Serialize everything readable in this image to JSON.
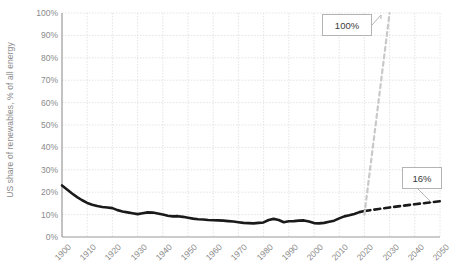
{
  "chart_data": {
    "type": "line",
    "title": "",
    "xlabel": "",
    "ylabel": "US share of renewables, % of all energy",
    "xlim": [
      1900,
      2050
    ],
    "ylim": [
      0,
      100
    ],
    "grid": true,
    "legend_position": "none",
    "ytick_labels": [
      "0%",
      "10%",
      "20%",
      "30%",
      "40%",
      "50%",
      "60%",
      "70%",
      "80%",
      "90%",
      "100%"
    ],
    "ytick_values": [
      0,
      10,
      20,
      30,
      40,
      50,
      60,
      70,
      80,
      90,
      100
    ],
    "xtick_labels": [
      "1900",
      "1910",
      "1920",
      "1930",
      "1940",
      "1950",
      "1960",
      "1970",
      "1980",
      "1990",
      "2000",
      "2010",
      "2020",
      "2030",
      "2040",
      "2050"
    ],
    "xtick_values": [
      1900,
      1910,
      1920,
      1930,
      1940,
      1950,
      1960,
      1970,
      1980,
      1990,
      2000,
      2010,
      2020,
      2030,
      2040,
      2050
    ],
    "series": [
      {
        "name": "Historical US renewable share",
        "style": "solid",
        "color": "#1a1a1a",
        "x": [
          1900,
          1902,
          1904,
          1906,
          1908,
          1910,
          1912,
          1914,
          1916,
          1918,
          1920,
          1922,
          1924,
          1926,
          1928,
          1930,
          1932,
          1934,
          1936,
          1938,
          1940,
          1942,
          1944,
          1946,
          1948,
          1950,
          1952,
          1954,
          1956,
          1958,
          1960,
          1962,
          1964,
          1966,
          1968,
          1970,
          1972,
          1974,
          1976,
          1978,
          1980,
          1982,
          1984,
          1986,
          1988,
          1990,
          1992,
          1994,
          1996,
          1998,
          2000,
          2002,
          2004,
          2006,
          2008,
          2010,
          2012,
          2014,
          2016,
          2018,
          2020
        ],
        "y": [
          23.0,
          21.2,
          19.4,
          17.8,
          16.4,
          15.2,
          14.4,
          13.8,
          13.4,
          13.2,
          12.9,
          12.0,
          11.4,
          11.0,
          10.6,
          10.2,
          10.6,
          11.0,
          10.9,
          10.5,
          10.0,
          9.5,
          9.2,
          9.3,
          9.0,
          8.6,
          8.2,
          7.9,
          7.8,
          7.6,
          7.5,
          7.4,
          7.3,
          7.1,
          6.9,
          6.6,
          6.3,
          6.2,
          6.1,
          6.3,
          6.5,
          7.6,
          8.1,
          7.6,
          6.6,
          7.0,
          7.1,
          7.3,
          7.4,
          6.9,
          6.2,
          6.1,
          6.3,
          6.8,
          7.3,
          8.3,
          9.2,
          9.7,
          10.3,
          11.1,
          11.6
        ]
      },
      {
        "name": "Projected US renewable share",
        "style": "dashed",
        "color": "#1a1a1a",
        "x": [
          2020,
          2025,
          2030,
          2035,
          2040,
          2045,
          2050
        ],
        "y": [
          11.6,
          12.4,
          13.2,
          13.9,
          14.6,
          15.3,
          16.0
        ]
      },
      {
        "name": "100% renewables pathway",
        "style": "dashed",
        "color": "#c9c9c9",
        "x": [
          2020,
          2022,
          2024,
          2026,
          2028,
          2030
        ],
        "y": [
          10.0,
          28.0,
          46.0,
          64.0,
          82.0,
          100.0
        ]
      }
    ],
    "annotations": [
      {
        "label": "100%",
        "target_x": 2030,
        "target_y": 100
      },
      {
        "label": "16%",
        "target_x": 2050,
        "target_y": 16
      }
    ]
  },
  "axis": {
    "y_title": "US share of renewables, % of all energy"
  }
}
